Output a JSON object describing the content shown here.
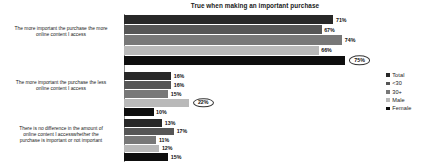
{
  "chart_data": {
    "type": "bar",
    "orientation": "horizontal",
    "title": "True when making an important purchase",
    "xlabel": "",
    "ylabel": "",
    "xlim": [
      0,
      80
    ],
    "grid": false,
    "legend_position": "right",
    "value_suffix": "%",
    "categories": [
      "The more important the purchase the more online content I access",
      "The more important the purchase the less online content I access",
      "There is no difference in the amount of online content I access whether the purchase is important or not important"
    ],
    "series": [
      {
        "name": "Total",
        "color": "#282828",
        "values": [
          71,
          16,
          13
        ]
      },
      {
        "name": "<30",
        "color": "#565656",
        "values": [
          67,
          16,
          17
        ]
      },
      {
        "name": "30+",
        "color": "#787878",
        "values": [
          74,
          15,
          11
        ]
      },
      {
        "name": "Male",
        "color": "#b9b9b9",
        "values": [
          66,
          22,
          12
        ]
      },
      {
        "name": "Female",
        "color": "#0e0e0e",
        "values": [
          75,
          10,
          15
        ]
      }
    ],
    "highlighted_points": [
      {
        "category_index": 0,
        "series_index": 4,
        "value": 75
      },
      {
        "category_index": 1,
        "series_index": 3,
        "value": 22
      }
    ]
  },
  "title": {
    "text": "True when making an important purchase"
  },
  "categories": [
    {
      "lines": [
        "The more important the purchase the more",
        "online content I access"
      ],
      "bars": [
        {
          "series": "Total",
          "label": "71%",
          "value": 71,
          "highlight": false
        },
        {
          "series": "<30",
          "label": "67%",
          "value": 67,
          "highlight": false
        },
        {
          "series": "30+",
          "label": "74%",
          "value": 74,
          "highlight": false
        },
        {
          "series": "Male",
          "label": "66%",
          "value": 66,
          "highlight": false
        },
        {
          "series": "Female",
          "label": "75%",
          "value": 75,
          "highlight": true
        }
      ]
    },
    {
      "lines": [
        "The more important the purchase the less",
        "online content I access"
      ],
      "bars": [
        {
          "series": "Total",
          "label": "16%",
          "value": 16,
          "highlight": false
        },
        {
          "series": "<30",
          "label": "16%",
          "value": 16,
          "highlight": false
        },
        {
          "series": "30+",
          "label": "15%",
          "value": 15,
          "highlight": false
        },
        {
          "series": "Male",
          "label": "22%",
          "value": 22,
          "highlight": true
        },
        {
          "series": "Female",
          "label": "10%",
          "value": 10,
          "highlight": false
        }
      ]
    },
    {
      "lines": [
        "There is no difference in the amount of",
        "online content I accesswhether the",
        "purchase is important or not important"
      ],
      "bars": [
        {
          "series": "Total",
          "label": "13%",
          "value": 13,
          "highlight": false
        },
        {
          "series": "<30",
          "label": "17%",
          "value": 17,
          "highlight": false
        },
        {
          "series": "30+",
          "label": "11%",
          "value": 11,
          "highlight": false
        },
        {
          "series": "Male",
          "label": "12%",
          "value": 12,
          "highlight": false
        },
        {
          "series": "Female",
          "label": "15%",
          "value": 15,
          "highlight": false
        }
      ]
    }
  ],
  "legend": {
    "items": [
      {
        "label": "Total",
        "color": "#282828"
      },
      {
        "label": "<30",
        "color": "#565656"
      },
      {
        "label": "30+",
        "color": "#787878"
      },
      {
        "label": "Male",
        "color": "#b9b9b9"
      },
      {
        "label": "Female",
        "color": "#0e0e0e"
      }
    ]
  },
  "scale": {
    "px_per_percent": 2.95
  }
}
